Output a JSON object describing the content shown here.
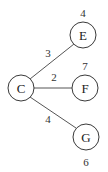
{
  "diagram": {
    "type": "weighted-tree",
    "nodes": [
      {
        "id": "C",
        "label": "C",
        "x": 21,
        "y": 88,
        "r": 13,
        "value": null
      },
      {
        "id": "E",
        "label": "E",
        "x": 83,
        "y": 35,
        "r": 13,
        "value": "4",
        "value_x": 83,
        "value_y": 17
      },
      {
        "id": "F",
        "label": "F",
        "x": 85,
        "y": 88,
        "r": 13,
        "value": "7",
        "value_x": 85,
        "value_y": 70
      },
      {
        "id": "G",
        "label": "G",
        "x": 86,
        "y": 137,
        "r": 13,
        "value": "6",
        "value_x": 86,
        "value_y": 166
      }
    ],
    "edges": [
      {
        "from": "C",
        "to": "E",
        "weight": "3",
        "label_x": 48,
        "label_y": 57
      },
      {
        "from": "C",
        "to": "F",
        "weight": "2",
        "label_x": 54,
        "label_y": 81
      },
      {
        "from": "C",
        "to": "G",
        "weight": "4",
        "label_x": 48,
        "label_y": 123
      }
    ]
  }
}
